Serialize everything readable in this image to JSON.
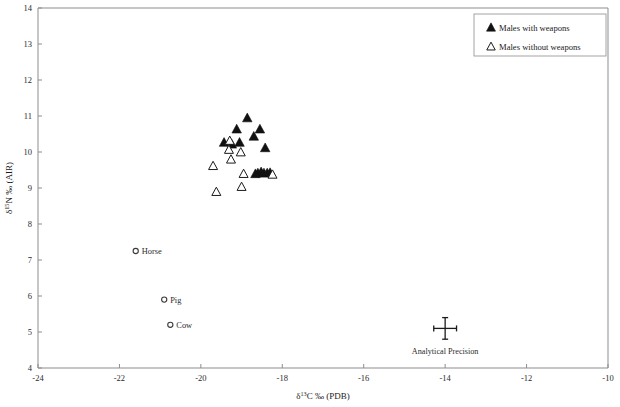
{
  "chart_data": {
    "type": "scatter",
    "title": "",
    "xlabel": "δ13C ‰ (PDB)",
    "ylabel": "δ15N ‰ (AIR)",
    "xlabel_parts": {
      "delta": "δ",
      "sup": "13",
      "rest": "C ‰ (PDB)"
    },
    "ylabel_parts": {
      "delta": "δ",
      "sup": "15",
      "rest": "N ‰ (AIR)"
    },
    "xlim": [
      -24,
      -10
    ],
    "ylim": [
      4,
      14
    ],
    "xticks": [
      -24,
      -22,
      -20,
      -18,
      -16,
      -14,
      -12,
      -10
    ],
    "xtick_labels": [
      "-24",
      "-22",
      "-20",
      "-18",
      "-16",
      "-14",
      "-12",
      "-10"
    ],
    "yticks": [
      4,
      5,
      6,
      7,
      8,
      9,
      10,
      11,
      12,
      13,
      14
    ],
    "ytick_labels": [
      "4",
      "5",
      "6",
      "7",
      "8",
      "9",
      "10",
      "11",
      "12",
      "13",
      "14"
    ],
    "grid": false,
    "legend_position": "top-right",
    "series": [
      {
        "name": "Males with weapons",
        "marker": "filled-triangle",
        "color": "#111111",
        "points": [
          [
            -18.86,
            10.93
          ],
          [
            -19.12,
            10.62
          ],
          [
            -18.55,
            10.62
          ],
          [
            -19.43,
            10.25
          ],
          [
            -19.05,
            10.25
          ],
          [
            -18.7,
            10.42
          ],
          [
            -19.24,
            10.2
          ],
          [
            -18.42,
            10.1
          ],
          [
            -18.3,
            9.41
          ],
          [
            -18.37,
            9.4
          ],
          [
            -18.45,
            9.4
          ],
          [
            -18.52,
            9.43
          ],
          [
            -18.6,
            9.4
          ],
          [
            -18.66,
            9.38
          ]
        ]
      },
      {
        "name": "Males without weapons",
        "marker": "open-triangle",
        "color": "#ffffff",
        "points": [
          [
            -19.29,
            10.3
          ],
          [
            -19.31,
            10.05
          ],
          [
            -19.26,
            9.78
          ],
          [
            -19.02,
            9.98
          ],
          [
            -19.7,
            9.6
          ],
          [
            -18.95,
            9.38
          ],
          [
            -18.24,
            9.36
          ],
          [
            -19.0,
            9.02
          ],
          [
            -19.62,
            8.88
          ]
        ]
      }
    ],
    "reference_points": [
      {
        "label": "Horse",
        "x": -21.6,
        "y": 7.25,
        "marker": "open-circle"
      },
      {
        "label": "Pig",
        "x": -20.9,
        "y": 5.9,
        "marker": "open-circle"
      },
      {
        "label": "Cow",
        "x": -20.75,
        "y": 5.2,
        "marker": "open-circle"
      }
    ],
    "annotations": [
      {
        "label": "Analytical Precision",
        "x": -14.0,
        "y": 5.1,
        "x_error": 0.28,
        "y_error": 0.3,
        "marker": "error-cross"
      }
    ]
  },
  "legend": {
    "items": [
      {
        "label": "Males with weapons",
        "marker": "filled-triangle"
      },
      {
        "label": "Males without weapons",
        "marker": "open-triangle"
      }
    ]
  }
}
